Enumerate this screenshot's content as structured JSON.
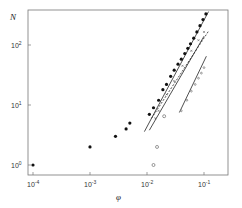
{
  "chart_data": {
    "type": "scatter",
    "title": "",
    "xlabel": "φ",
    "ylabel": "N",
    "xscale": "log",
    "yscale": "log",
    "xlim": [
      8e-05,
      0.25
    ],
    "ylim": [
      0.85,
      450
    ],
    "grid": false,
    "legend": null,
    "x_ticks": [
      {
        "value": 0.0001,
        "base": "10",
        "exp": "-4"
      },
      {
        "value": 0.001,
        "base": "10",
        "exp": "-3"
      },
      {
        "value": 0.01,
        "base": "10",
        "exp": "-2"
      },
      {
        "value": 0.1,
        "base": "10",
        "exp": "-1"
      }
    ],
    "y_ticks": [
      {
        "value": 1,
        "base": "10",
        "exp": "0"
      },
      {
        "value": 10,
        "base": "10",
        "exp": "1"
      },
      {
        "value": 100,
        "base": "10",
        "exp": "2"
      }
    ],
    "series": [
      {
        "name": "filled circles",
        "marker": "filled-circle",
        "points": [
          [
            0.0001,
            1.0
          ],
          [
            0.001,
            2.0
          ],
          [
            0.0028,
            3.0
          ],
          [
            0.0043,
            4.0
          ],
          [
            0.005,
            5.0
          ],
          [
            0.011,
            7.0
          ],
          [
            0.013,
            9.0
          ],
          [
            0.016,
            12
          ],
          [
            0.019,
            18
          ],
          [
            0.022,
            22
          ],
          [
            0.026,
            30
          ],
          [
            0.03,
            38
          ],
          [
            0.035,
            48
          ],
          [
            0.04,
            58
          ],
          [
            0.046,
            72
          ],
          [
            0.052,
            88
          ],
          [
            0.058,
            105
          ],
          [
            0.066,
            130
          ],
          [
            0.075,
            165
          ],
          [
            0.085,
            210
          ],
          [
            0.096,
            265
          ],
          [
            0.108,
            330
          ]
        ]
      },
      {
        "name": "open circles",
        "marker": "open-circle",
        "points": [
          [
            0.013,
            1.0
          ],
          [
            0.015,
            2.0
          ],
          [
            0.02,
            6.5
          ]
        ]
      },
      {
        "name": "crosses",
        "marker": "cross",
        "points": [
          [
            0.014,
            6.0
          ],
          [
            0.016,
            8.0
          ],
          [
            0.022,
            15
          ],
          [
            0.03,
            25
          ],
          [
            0.042,
            45
          ],
          [
            0.06,
            80
          ],
          [
            0.08,
            120
          ],
          [
            0.1,
            165
          ]
        ]
      },
      {
        "name": "small open circles (right)",
        "marker": "small-open-circle",
        "points": [
          [
            0.04,
            8
          ],
          [
            0.05,
            12
          ],
          [
            0.06,
            17
          ],
          [
            0.07,
            22
          ],
          [
            0.08,
            28
          ],
          [
            0.09,
            34
          ],
          [
            0.1,
            42
          ]
        ]
      }
    ],
    "lines": [
      {
        "name": "fit solid",
        "style": "solid",
        "from": [
          0.009,
          3.6
        ],
        "to": [
          0.12,
          360
        ]
      },
      {
        "name": "fit solid 2",
        "style": "solid",
        "from": [
          0.011,
          3.8
        ],
        "to": [
          0.1,
          140
        ]
      },
      {
        "name": "fit dashed",
        "style": "dashed",
        "from": [
          0.012,
          6.0
        ],
        "to": [
          0.12,
          170
        ]
      },
      {
        "name": "fit solid 3",
        "style": "solid",
        "from": [
          0.037,
          7.5
        ],
        "to": [
          0.11,
          65
        ]
      }
    ]
  }
}
